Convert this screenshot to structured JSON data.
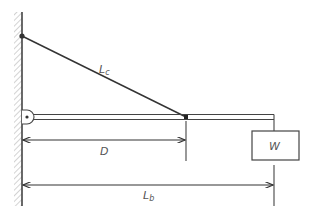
{
  "diagram": {
    "type": "cantilever-beam-with-cable",
    "colors": {
      "line": "#333333",
      "hatch": "#aaaaaa",
      "label": "#555555",
      "background": "#ffffff"
    },
    "labels": {
      "cable": "L",
      "cable_sub": "c",
      "distance": "D",
      "weight": "W",
      "beam_length": "L",
      "beam_length_sub": "b"
    },
    "elements": [
      "wall (hatched)",
      "cable anchor point",
      "cable L_c",
      "hinged beam",
      "cable-beam connection",
      "dimension D",
      "hanging weight W",
      "dimension L_b"
    ]
  }
}
